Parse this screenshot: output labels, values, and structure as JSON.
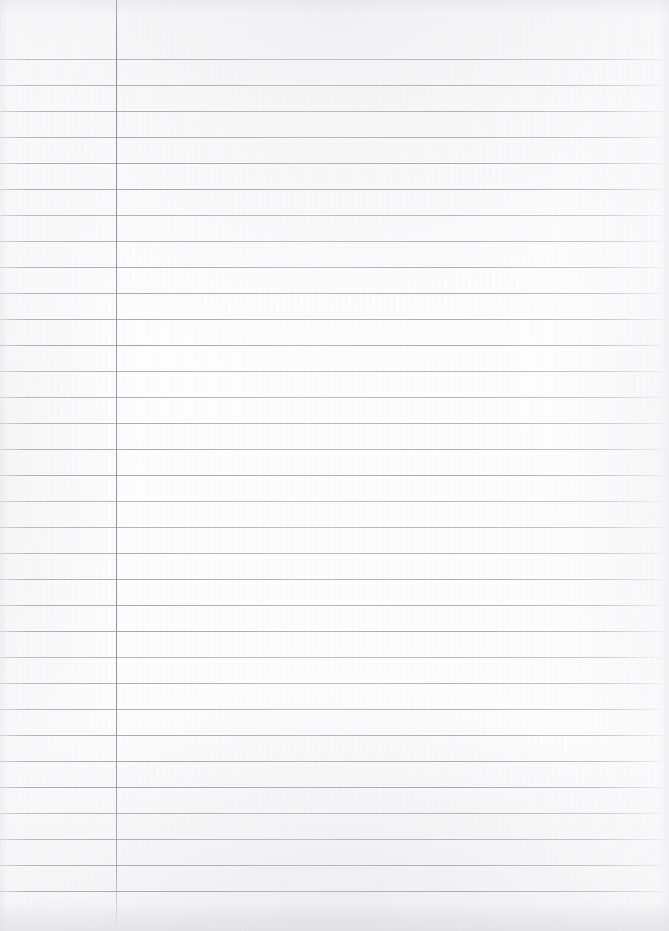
{
  "document": {
    "kind": "scanned-ruled-notebook-page",
    "title": "Blank Lined Notebook Page",
    "page_width": 669,
    "page_height": 931,
    "paper_color": "#fdfdfd",
    "content_text": "",
    "is_blank": true,
    "handwriting_present": false,
    "printed_text_present": false
  },
  "ruling": {
    "horizontal_line_color": "#a3a3aa",
    "horizontal_line_count": 33,
    "first_line_y": 59,
    "line_spacing": 26,
    "line_start_x": 0,
    "line_end_x": 665,
    "line_thickness": 1
  },
  "margin": {
    "vertical_line_color": "#91919a",
    "vertical_line_x": 116,
    "vertical_line_top": 0,
    "vertical_line_bottom": 925,
    "vertical_line_thickness": 1,
    "left_column_width": 116
  },
  "scan_artifacts": {
    "top_shadow_color": "#d4d4da",
    "bottom_shadow_color": "#cccdd4",
    "edge_vignette_color": "#d6d6dc",
    "grain_opacity": 0.55
  }
}
